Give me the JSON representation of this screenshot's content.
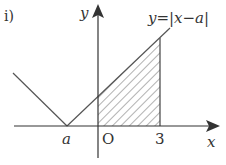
{
  "figure": {
    "problem_label": "i)",
    "equation_label": "y=|x−a|",
    "axes": {
      "x_label": "x",
      "y_label": "y",
      "origin_label": "O"
    },
    "tick_labels": {
      "a": "a",
      "three": "3"
    },
    "shaded_region": {
      "description": "area under y=|x-a| from x=0 to x=3",
      "from": "0",
      "to": "3",
      "pattern": "diagonal hatching"
    },
    "colors": {
      "axis": "#333333",
      "curve": "#555555",
      "hatch": "#666666",
      "text": "#333333"
    }
  }
}
